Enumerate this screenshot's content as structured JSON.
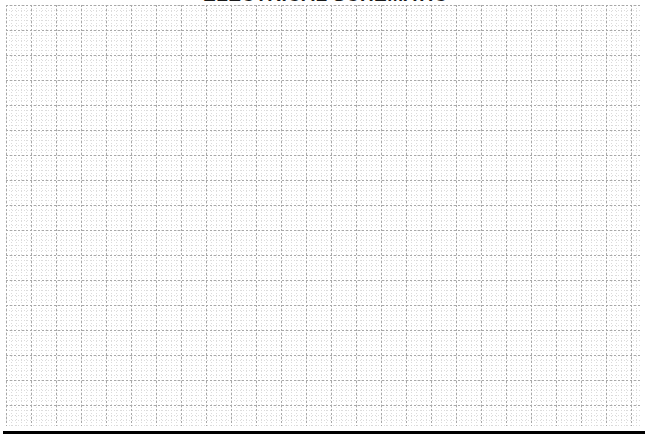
{
  "page": {
    "width": 651,
    "height": 441,
    "background_color": "#ffffff"
  },
  "title": {
    "text": "ELECTRICAL SCHEMATIC",
    "clipped": "true",
    "align": "center",
    "color": "#1a1a1a",
    "weight": "bold"
  },
  "grid": {
    "label": "graph-paper-grid",
    "left": 6,
    "top": 5,
    "width": 634,
    "height": 421,
    "minor_spacing_px": 5,
    "major_spacing_px": 25,
    "minor_color": "#dcdcdc",
    "major_color": "#a8a8a8",
    "line_style": "dotted",
    "background_color": "#ffffff"
  },
  "bottom_rule": {
    "label": "bottom-border-rule",
    "left": 3,
    "top": 431,
    "width": 642,
    "height": 3,
    "color": "#000000"
  }
}
